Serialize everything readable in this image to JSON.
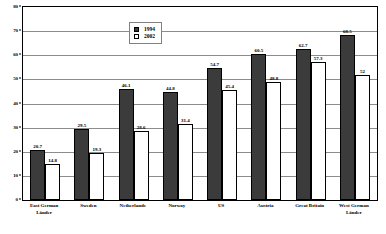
{
  "chart_data": {
    "type": "bar",
    "title": "",
    "subtitle": "",
    "xlabel": "",
    "ylabel": "",
    "ylim": [
      0,
      80
    ],
    "ytick_step": 10,
    "yticks": [
      "0",
      "10",
      "20",
      "30",
      "40",
      "50",
      "60",
      "70",
      "80"
    ],
    "grid": true,
    "legend_position": "upper-left-center",
    "categories": [
      "East German Länder",
      "Sweden",
      "Netherlands",
      "Norway",
      "US",
      "Austria",
      "Great Britain",
      "West German Länder"
    ],
    "series": [
      {
        "name": "1994",
        "color": "#3b3b3b",
        "values": [
          20.7,
          29.5,
          46.1,
          44.8,
          54.7,
          60.5,
          62.7,
          68.5
        ],
        "labels": [
          "20.7",
          "29.5",
          "46.1",
          "44.8",
          "54.7",
          "60.5",
          "62.7",
          "68.5"
        ]
      },
      {
        "name": "2002",
        "color": "#ffffff",
        "values": [
          14.8,
          19.3,
          28.6,
          31.4,
          45.4,
          48.8,
          57.3,
          52.0
        ],
        "labels": [
          "14.8",
          "19.3",
          "28.6",
          "31.4",
          "45.4",
          "48.8",
          "57.3",
          "52"
        ]
      }
    ]
  },
  "legend": {
    "items": [
      {
        "label": "1994",
        "swatch": "filled-square-icon"
      },
      {
        "label": "2002",
        "swatch": "empty-square-icon"
      }
    ]
  }
}
